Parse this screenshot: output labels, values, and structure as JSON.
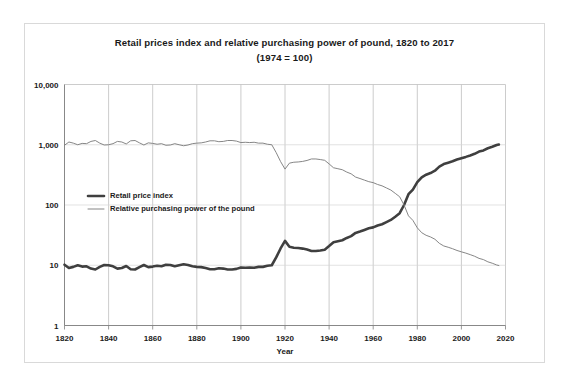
{
  "chart_data": {
    "type": "line",
    "title": "Retail prices index and relative purchasing power of pound, 1820 to 2017",
    "subtitle": "(1974 = 100)",
    "xlabel": "Year",
    "ylabel": "",
    "xlim": [
      1820,
      2020
    ],
    "ylim": [
      1,
      10000
    ],
    "yscale": "log",
    "grid": true,
    "legend_position": "inside-left",
    "xticks": [
      1820,
      1840,
      1860,
      1880,
      1900,
      1920,
      1940,
      1960,
      1980,
      2000,
      2020
    ],
    "xticklabels": [
      "1820",
      "1840",
      "1860",
      "1880",
      "1900",
      "1920",
      "1940",
      "1960",
      "1980",
      "2000",
      "2020"
    ],
    "yticks": [
      1,
      10,
      100,
      1000,
      10000
    ],
    "yticklabels": [
      "1",
      "10",
      "100",
      "1,000",
      "10,000"
    ],
    "colors": {
      "retail_price_index": "#3f3f3f",
      "relative_purchasing_power": "#808080",
      "gridline": "#bfbfbf",
      "frame": "#d9d9d9",
      "text": "#1a1a1a"
    },
    "x": [
      1820,
      1822,
      1824,
      1826,
      1828,
      1830,
      1832,
      1834,
      1836,
      1838,
      1840,
      1842,
      1844,
      1846,
      1848,
      1850,
      1852,
      1854,
      1856,
      1858,
      1860,
      1862,
      1864,
      1866,
      1868,
      1870,
      1872,
      1874,
      1876,
      1878,
      1880,
      1882,
      1884,
      1886,
      1888,
      1890,
      1892,
      1894,
      1896,
      1898,
      1900,
      1902,
      1904,
      1906,
      1908,
      1910,
      1912,
      1914,
      1916,
      1918,
      1920,
      1922,
      1924,
      1926,
      1928,
      1930,
      1932,
      1934,
      1936,
      1938,
      1940,
      1942,
      1944,
      1946,
      1948,
      1950,
      1952,
      1954,
      1956,
      1958,
      1960,
      1962,
      1964,
      1966,
      1968,
      1970,
      1972,
      1974,
      1976,
      1978,
      1980,
      1982,
      1984,
      1986,
      1988,
      1990,
      1992,
      1994,
      1996,
      1998,
      2000,
      2002,
      2004,
      2006,
      2008,
      2010,
      2012,
      2014,
      2016,
      2017
    ],
    "series": [
      {
        "name": "Retail price index",
        "style": "thick",
        "values": [
          10.2,
          9.0,
          9.4,
          10.0,
          9.5,
          9.6,
          8.8,
          8.5,
          9.4,
          10.1,
          10.0,
          9.6,
          8.8,
          9.0,
          9.7,
          8.6,
          8.5,
          9.3,
          10.1,
          9.3,
          9.5,
          9.8,
          9.6,
          10.2,
          10.1,
          9.6,
          10.0,
          10.4,
          10.1,
          9.6,
          9.4,
          9.3,
          9.0,
          8.6,
          8.6,
          8.9,
          8.8,
          8.5,
          8.5,
          8.7,
          9.2,
          9.1,
          9.2,
          9.1,
          9.4,
          9.4,
          9.8,
          10.0,
          13.5,
          19.0,
          25.4,
          20.2,
          19.5,
          19.3,
          18.9,
          18.2,
          17.2,
          17.2,
          17.6,
          18.1,
          20.8,
          24.1,
          25.0,
          26.0,
          28.4,
          30.4,
          34.4,
          36.3,
          38.6,
          41.0,
          42.5,
          45.6,
          48.0,
          52.0,
          56.5,
          64.0,
          73.0,
          100.0,
          151.0,
          180.0,
          239.0,
          288.0,
          318.0,
          339.0,
          371.0,
          433.0,
          478.0,
          503.0,
          531.0,
          568.0,
          598.0,
          629.0,
          665.0,
          708.0,
          770.0,
          804.0,
          875.0,
          925.0,
          990.0,
          1010.0
        ]
      },
      {
        "name": "Relative purchasing power of the pound",
        "style": "thin",
        "values": [
          980,
          1111,
          1064,
          1000,
          1053,
          1042,
          1136,
          1176,
          1064,
          990,
          1000,
          1042,
          1136,
          1111,
          1031,
          1163,
          1176,
          1075,
          990,
          1075,
          1053,
          1020,
          1042,
          980,
          990,
          1042,
          1000,
          962,
          990,
          1042,
          1064,
          1075,
          1111,
          1163,
          1163,
          1124,
          1136,
          1176,
          1176,
          1149,
          1087,
          1099,
          1087,
          1099,
          1064,
          1064,
          1020,
          1000,
          741,
          526,
          394,
          495,
          513,
          518,
          529,
          549,
          581,
          581,
          568,
          552,
          481,
          415,
          400,
          385,
          352,
          329,
          291,
          275,
          259,
          244,
          235,
          219,
          208,
          192,
          177,
          156,
          137,
          100,
          66,
          55.6,
          41.8,
          34.7,
          31.4,
          29.5,
          27.0,
          23.1,
          20.9,
          19.9,
          18.8,
          17.6,
          16.7,
          15.9,
          15.0,
          14.1,
          13.0,
          12.4,
          11.4,
          10.8,
          10.1,
          9.9
        ]
      }
    ]
  },
  "legend": {
    "items": [
      {
        "label": "Retail price index"
      },
      {
        "label": "Relative purchasing power of the pound"
      }
    ]
  }
}
